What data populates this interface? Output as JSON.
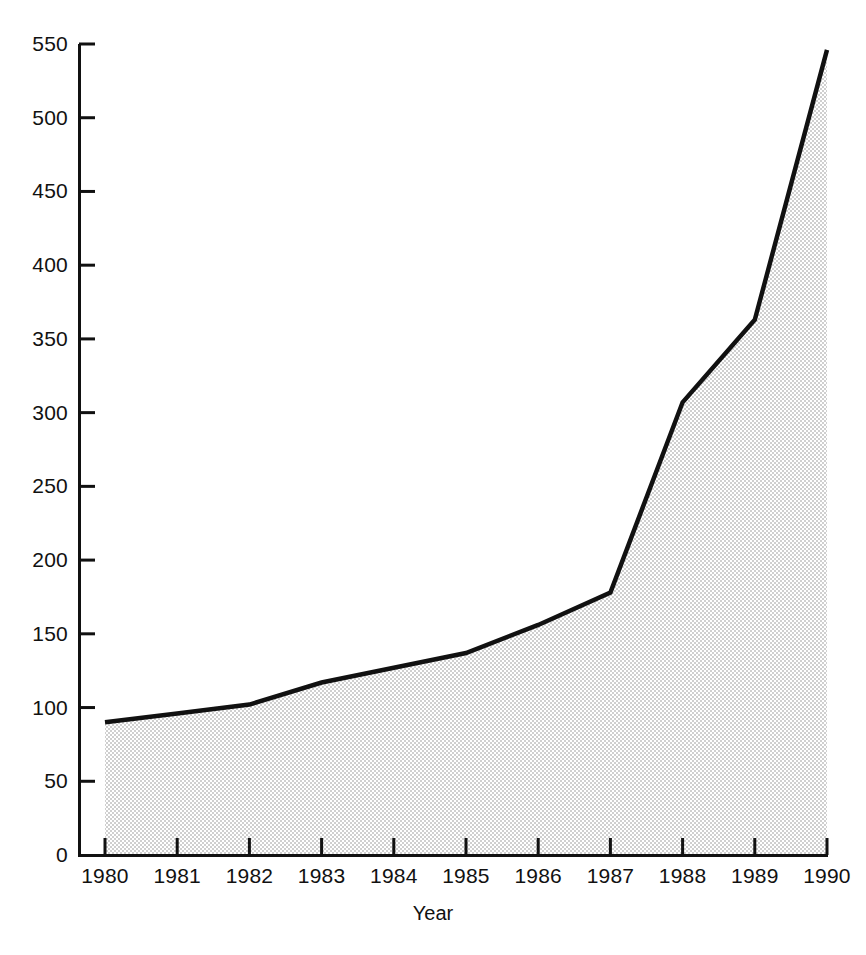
{
  "chart_data": {
    "type": "area",
    "title": "",
    "subtitle": "",
    "xlabel": "Year",
    "ylabel": "",
    "categories": [
      "1980",
      "1981",
      "1982",
      "1983",
      "1984",
      "1985",
      "1986",
      "1987",
      "1988",
      "1989",
      "1990"
    ],
    "x": [
      1980,
      1981,
      1982,
      1983,
      1984,
      1985,
      1986,
      1987,
      1988,
      1989,
      1990
    ],
    "values": [
      90,
      96,
      102,
      117,
      127,
      137,
      156,
      178,
      307,
      363,
      546
    ],
    "series": [
      {
        "name": "",
        "values": [
          90,
          96,
          102,
          117,
          127,
          137,
          156,
          178,
          307,
          363,
          546
        ]
      }
    ],
    "xlim": [
      1980,
      1990
    ],
    "ylim": [
      0,
      550
    ],
    "ytick_values": [
      0,
      50,
      100,
      150,
      200,
      250,
      300,
      350,
      400,
      450,
      500,
      550
    ],
    "ytick_labels": [
      "0",
      "50",
      "100",
      "150",
      "200",
      "250",
      "300",
      "350",
      "400",
      "450",
      "500",
      "550"
    ],
    "xtick_labels": [
      "1980",
      "1981",
      "1982",
      "1983",
      "1984",
      "1985",
      "1986",
      "1987",
      "1988",
      "1989",
      "1990"
    ],
    "grid": false,
    "legend": "none",
    "annotations": [],
    "style": {
      "line_color": "#111111",
      "line_width": 4,
      "fill_pattern": "fine-checker-dots",
      "fill_color": "#d9d9d9",
      "axis_color": "#111111",
      "background": "#ffffff"
    }
  },
  "axes": {
    "x_title": "Year"
  }
}
